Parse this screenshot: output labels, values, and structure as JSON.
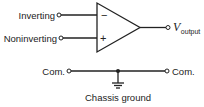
{
  "diagram": {
    "type": "op-amp symbol",
    "inputs": {
      "inverting_label": "Inverting",
      "noninverting_label": "Noninverting",
      "minus_symbol": "−",
      "plus_symbol": "+"
    },
    "output": {
      "label_main": "V",
      "label_sub": "output"
    },
    "common": {
      "left_label": "Com.",
      "right_label": "Com."
    },
    "ground": {
      "label": "Chassis ground"
    },
    "colors": {
      "stroke": "#222222",
      "background": "#ffffff"
    }
  }
}
